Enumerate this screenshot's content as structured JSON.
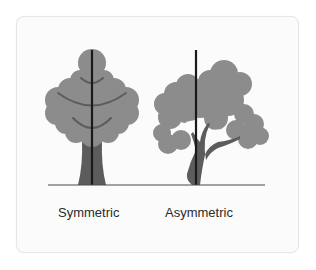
{
  "figure": {
    "colors": {
      "foliage": "#8c8c8c",
      "trunk": "#5c5c5c",
      "axis": "#1a1a1a",
      "ground": "#4a4a4a",
      "card_background": "#fbfbfb"
    },
    "trees": [
      {
        "label": "Symmetric",
        "axis_x": 92
      },
      {
        "label": "Asymmetric",
        "axis_x": 196
      }
    ],
    "ground": {
      "y": 185,
      "x_start": 48,
      "x_end": 265
    }
  }
}
